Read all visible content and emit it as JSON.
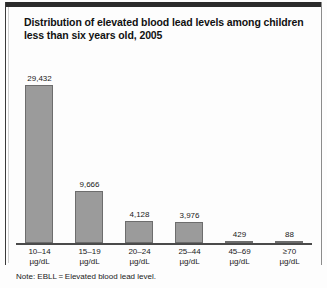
{
  "figure": {
    "title_line1": "Distribution of elevated blood lead levels among children",
    "title_line2": "less than six years old, 2005",
    "note": "Note: EBLL = Elevated blood lead level."
  },
  "chart_data": {
    "type": "bar",
    "title": "Distribution of elevated blood lead levels among children less than six years old, 2005",
    "xlabel": "",
    "ylabel": "",
    "grid": false,
    "legend": "none",
    "ylim": [
      0,
      30000
    ],
    "categories": [
      "10–14 µg/dL",
      "15–19 µg/dL",
      "20–24 µg/dL",
      "25–44 µg/dL",
      "45–69 µg/dL",
      "≥70 µg/dL"
    ],
    "category_ranges": [
      "10–14",
      "15–19",
      "20–24",
      "25–44",
      "45–69",
      "≥70"
    ],
    "category_units": [
      "µg/dL",
      "µg/dL",
      "µg/dL",
      "µg/dL",
      "µg/dL",
      "µg/dL"
    ],
    "values": [
      29432,
      9666,
      4128,
      3976,
      429,
      88
    ],
    "value_labels": [
      "29,432",
      "9,666",
      "4,128",
      "3,976",
      "429",
      "88"
    ],
    "bar_color": "#9b9b9b",
    "bar_edge_color": "#6d6d6d",
    "axis_color": "#4a4a4a"
  }
}
